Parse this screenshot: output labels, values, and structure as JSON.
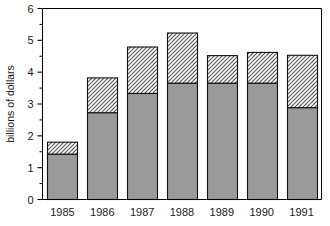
{
  "chart_data": {
    "type": "bar",
    "subtype": "stacked-bar",
    "title": "",
    "subtitle": "",
    "xlabel": "",
    "ylabel": "billions of dollars",
    "categories": [
      "1985",
      "1986",
      "1987",
      "1988",
      "1989",
      "1990",
      "1991"
    ],
    "series": [
      {
        "name": "lower-segment",
        "style": "solid-gray",
        "color": "#9a9a9a",
        "values": [
          1.42,
          2.72,
          3.33,
          3.65,
          3.65,
          3.65,
          2.88
        ]
      },
      {
        "name": "upper-segment",
        "style": "diagonal-hatch",
        "color": "#ffffff",
        "values": [
          0.38,
          1.1,
          1.46,
          1.58,
          0.87,
          0.97,
          1.65
        ]
      }
    ],
    "totals": [
      1.8,
      3.82,
      4.79,
      5.23,
      4.52,
      4.62,
      4.53
    ],
    "segment_boundaries": [
      1.42,
      2.72,
      3.33,
      3.65,
      3.65,
      3.65,
      2.88
    ],
    "ylim": [
      0,
      6
    ],
    "y_ticks_major": [
      0,
      1,
      2,
      3,
      4,
      5,
      6
    ],
    "y_tick_labels": [
      "0",
      "1",
      "2",
      "3",
      "4",
      "5",
      "6"
    ],
    "y_ticks_minor": [
      0.5,
      1.5,
      2.5,
      3.5,
      4.5,
      5.5
    ],
    "grid": false,
    "legend": "none",
    "annotations": []
  },
  "axes": {
    "y_axis_title": "billions of dollars",
    "y_labels": [
      "6",
      "5",
      "4",
      "3",
      "2",
      "1",
      "0"
    ],
    "x_labels": [
      "1985",
      "1986",
      "1987",
      "1988",
      "1989",
      "1990",
      "1991"
    ]
  },
  "colors": {
    "lower_segment": "#9a9a9a",
    "upper_segment_base": "#ffffff",
    "hatch_stroke": "#5a5a5a",
    "outline": "#111111",
    "frame": "#000000",
    "text": "#1a1a1a",
    "background": "#ffffff"
  }
}
